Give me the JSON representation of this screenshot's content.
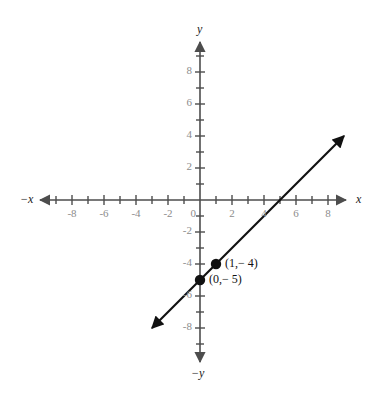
{
  "chart_data": {
    "type": "line",
    "title": "",
    "xlabel": "x",
    "ylabel": "y",
    "grid": false,
    "legend": "none",
    "xlim": [
      -9,
      9
    ],
    "ylim": [
      -9,
      9
    ],
    "x_tick_labels": [
      "-8",
      "-6",
      "-4",
      "-2",
      "0",
      "2",
      "4",
      "6",
      "8"
    ],
    "x_tick_values": [
      -8,
      -6,
      -4,
      -2,
      0,
      2,
      4,
      6,
      8
    ],
    "y_tick_labels": [
      "8",
      "6",
      "4",
      "2",
      "-2",
      "-4",
      "-6",
      "-8"
    ],
    "y_tick_values": [
      8,
      6,
      4,
      2,
      -2,
      -4,
      -6,
      -8
    ],
    "minor_tick_step": 1,
    "series": [
      {
        "name": "y = x - 5",
        "slope": 1,
        "intercept": -5,
        "x_start": -3.0,
        "y_start": -8.0,
        "x_end": 9.0,
        "y_end": 4.0,
        "arrow_start": true,
        "arrow_end": true,
        "color": "#111111"
      }
    ],
    "points": [
      {
        "x": 1,
        "y": -4,
        "label": "(1,− 4)"
      },
      {
        "x": 0,
        "y": -5,
        "label": "(0,− 5)"
      }
    ],
    "x_intercept": 5,
    "y_intercept": -5
  },
  "axis_labels": {
    "x_positive": "x",
    "x_negative": "−x",
    "y_positive": "y",
    "y_negative": "−y"
  },
  "colors": {
    "background": "#ffffff",
    "axis": "#4d4d4d",
    "tick_label": "#8c8c8c",
    "line": "#111111",
    "point": "#111111"
  }
}
